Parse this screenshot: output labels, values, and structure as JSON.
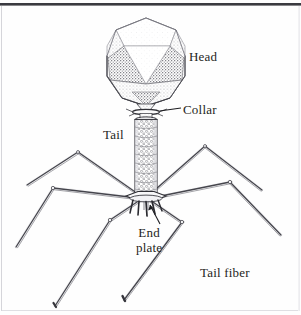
{
  "figure": {
    "style": "stippled-pen-and-ink-line-drawing",
    "background_color": "#fefefe",
    "ink_color": "#1e1e22",
    "stipple_color": "#6d6d73",
    "border": {
      "top_rule_color": "#3a3a40",
      "side_rule_color": "#c9c9cf",
      "bottom_rule_color": "#d3d3d8"
    }
  },
  "labels": {
    "head": "Head",
    "collar": "Collar",
    "tail": "Tail",
    "end_plate_line1": "End",
    "end_plate_line2": "plate",
    "tail_fiber": "Tail fiber"
  },
  "parts": {
    "head": {
      "name": "Head",
      "shape": "icosahedral capsid",
      "center_x": 146,
      "center_y": 62,
      "width": 78,
      "height": 88
    },
    "collar": {
      "name": "Collar",
      "shape": "disc with whiskers",
      "center_x": 144,
      "center_y": 112,
      "width": 26,
      "height": 6
    },
    "tail": {
      "name": "Tail",
      "shape": "contractile helical sheath",
      "center_x": 144,
      "top_y": 118,
      "bottom_y": 196,
      "width": 22
    },
    "end_plate": {
      "name": "End plate",
      "shape": "hexagonal base plate with tail pins",
      "center_x": 144,
      "center_y": 198,
      "width": 40,
      "height": 8
    },
    "tail_fibers": {
      "name": "Tail fiber",
      "shape": "jointed bent fibers",
      "count": 6
    }
  }
}
